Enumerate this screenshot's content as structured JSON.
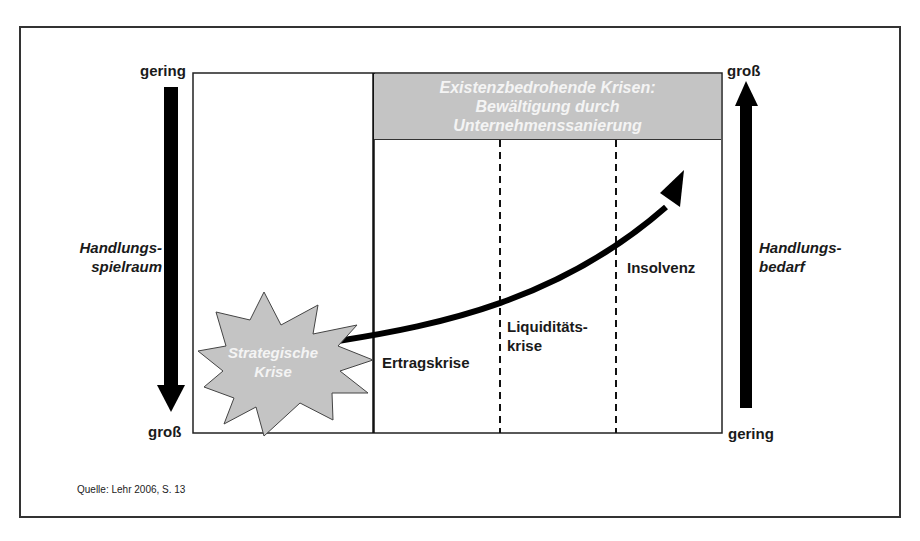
{
  "diagram": {
    "left_axis": {
      "top_label": "gering",
      "bottom_label": "groß",
      "title_line1": "Handlungs-",
      "title_line2": "spielraum",
      "direction": "down"
    },
    "right_axis": {
      "top_label": "groß",
      "bottom_label": "gering",
      "title_line1": "Handlungs-",
      "title_line2": "bedarf",
      "direction": "up"
    },
    "banner": {
      "line1": "Existenzbedrohende Krisen:",
      "line2": "Bewältigung durch",
      "line3": "Unternehmenssanierung",
      "fill": "#c4c4c4"
    },
    "starburst": {
      "line1": "Strategische",
      "line2": "Krise",
      "fill": "#c4c4c4"
    },
    "phases": [
      {
        "line1": "Ertragskrise",
        "line2": ""
      },
      {
        "line1": "Liquiditäts-",
        "line2": "krise"
      },
      {
        "line1": "Insolvenz",
        "line2": ""
      }
    ],
    "source": "Quelle: Lehr 2006, S. 13"
  }
}
